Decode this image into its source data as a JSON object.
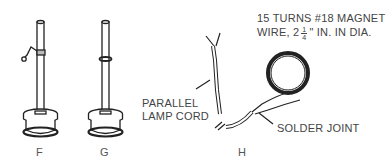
{
  "figures": [
    {
      "id": "F",
      "label": "F",
      "description": "rod on spool with clip attached"
    },
    {
      "id": "G",
      "label": "G",
      "description": "rod on spool with ring band"
    },
    {
      "id": "H",
      "label": "H",
      "description": "lamp cord connected to magnet wire coil"
    }
  ],
  "annotations": {
    "coil_line1": "15 TURNS  #18 MAGNET",
    "coil_line2_prefix": "WIRE, 2",
    "coil_frac_num": "1",
    "coil_frac_den": "4",
    "coil_line2_suffix": "\" IN. IN DIA.",
    "cord_line1": "PARALLEL",
    "cord_line2": "LAMP CORD",
    "joint": "SOLDER JOINT"
  },
  "colors": {
    "ink": "#222222",
    "text": "#444444",
    "background": "#ffffff"
  }
}
